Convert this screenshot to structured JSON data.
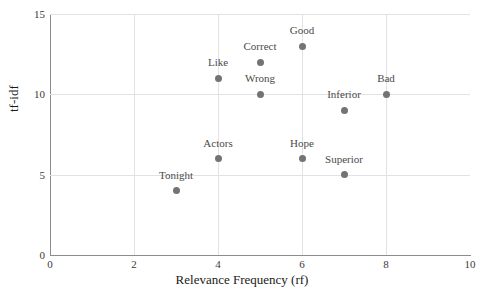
{
  "artifact": {
    "top_right_text": "                     "
  },
  "chart_data": {
    "type": "scatter",
    "title": "",
    "xlabel": "Relevance Frequency (rf)",
    "ylabel": "tf-idf",
    "xlim": [
      0,
      10
    ],
    "ylim": [
      0,
      15
    ],
    "xticks": [
      0,
      2,
      4,
      6,
      8,
      10
    ],
    "yticks": [
      0,
      5,
      10,
      15
    ],
    "xtick_labels": [
      "0",
      "2",
      "4",
      "6",
      "8",
      "10"
    ],
    "ytick_labels": [
      "0",
      "5",
      "10",
      "15"
    ],
    "grid": true,
    "legend": null,
    "marker_color": "#737373",
    "gridline_color": "#e2e2e6",
    "axis_color": "#8c8c8c",
    "points": [
      {
        "label": "Tonight",
        "x": 3,
        "y": 4,
        "label_dx": 0,
        "label_dy": -14
      },
      {
        "label": "Like",
        "x": 4,
        "y": 11,
        "label_dx": 0,
        "label_dy": -14
      },
      {
        "label": "Actors",
        "x": 4,
        "y": 6,
        "label_dx": 0,
        "label_dy": -14
      },
      {
        "label": "Correct",
        "x": 5,
        "y": 12,
        "label_dx": 0,
        "label_dy": -14
      },
      {
        "label": "Wrong",
        "x": 5,
        "y": 10,
        "label_dx": 0,
        "label_dy": -14
      },
      {
        "label": "Good",
        "x": 6,
        "y": 13,
        "label_dx": 0,
        "label_dy": -14
      },
      {
        "label": "Hope",
        "x": 6,
        "y": 6,
        "label_dx": 0,
        "label_dy": -14
      },
      {
        "label": "Inferior",
        "x": 7,
        "y": 9,
        "label_dx": 0,
        "label_dy": -14
      },
      {
        "label": "Superior",
        "x": 7,
        "y": 5,
        "label_dx": 0,
        "label_dy": -14
      },
      {
        "label": "Bad",
        "x": 8,
        "y": 10,
        "label_dx": 0,
        "label_dy": -14
      }
    ]
  }
}
